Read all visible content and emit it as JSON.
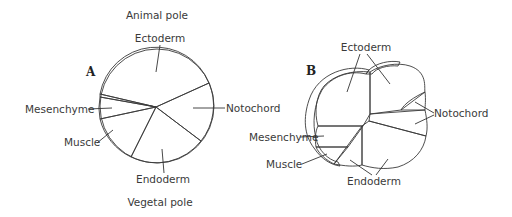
{
  "figure": {
    "panel_a": {
      "label": "A",
      "top_label": "Animal pole",
      "bottom_label": "Vegetal pole",
      "regions": {
        "ectoderm": "Ectoderm",
        "notochord": "Notochord",
        "endoderm": "Endoderm",
        "muscle": "Muscle",
        "mesenchyme": "Mesenchyme"
      }
    },
    "panel_b": {
      "label": "B",
      "regions": {
        "ectoderm": "Ectoderm",
        "notochord": "Notochord",
        "endoderm": "Endoderm",
        "muscle": "Muscle",
        "mesenchyme": "Mesenchyme"
      }
    },
    "colors": {
      "ectoderm": "#ffffff",
      "notochord": "#dcdcdc",
      "endoderm": "#f2f2f2",
      "muscle": "#c4c4c4",
      "mesenchyme": "#7a7a7a",
      "outline": "#3a3a3a"
    }
  }
}
